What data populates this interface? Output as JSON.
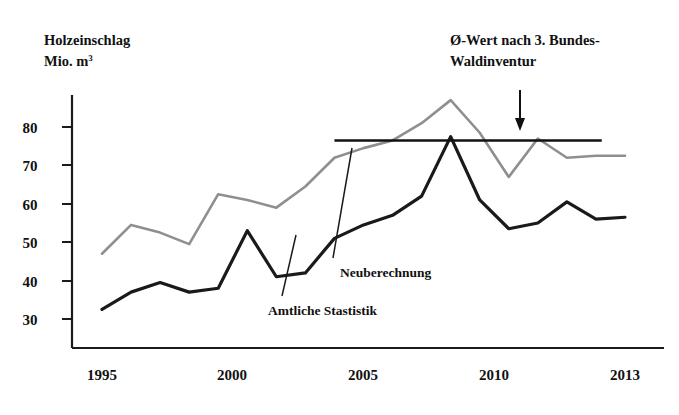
{
  "chart_data": {
    "type": "line",
    "title": "Holzeinschlag",
    "subtitle": "Mio. m³",
    "ylabel": "Holzeinschlag Mio. m3",
    "xlabel": "",
    "xlim": [
      1995,
      2013
    ],
    "ylim": [
      25,
      90
    ],
    "grid": false,
    "legend": "inline-annotations",
    "x": [
      1995,
      1996,
      1997,
      1998,
      1999,
      2000,
      2001,
      2002,
      2003,
      2004,
      2005,
      2006,
      2007,
      2008,
      2009,
      2010,
      2011,
      2012,
      2013
    ],
    "y_ticks": [
      30,
      40,
      50,
      60,
      70,
      80
    ],
    "x_ticks": [
      1995,
      2000,
      2005,
      2010,
      2013
    ],
    "series": [
      {
        "name": "Amtliche Stastistik",
        "color": "#1a1a1a",
        "values": [
          32.5,
          37.0,
          39.5,
          37.0,
          38.0,
          53.0,
          41.0,
          42.0,
          51.0,
          54.5,
          57.0,
          62.0,
          77.5,
          61.0,
          53.5,
          55.0,
          60.5,
          56.0,
          56.5
        ]
      },
      {
        "name": "Neuberechnung",
        "color": "#8f8f8f",
        "values": [
          47.0,
          54.5,
          52.5,
          49.5,
          62.5,
          61.0,
          59.0,
          64.5,
          72.0,
          74.5,
          76.5,
          81.0,
          87.0,
          78.5,
          67.0,
          77.0,
          72.0,
          72.5,
          72.5
        ]
      }
    ],
    "reference_line": {
      "label": "Ø-Wert nach 3. Bundes-Waldinventur",
      "value": 76.5,
      "x_start": 2003,
      "x_end": 2012.2,
      "color": "#111111"
    },
    "annotations": [
      {
        "name": "neuberechnung-label",
        "text": "Neuberechnung"
      },
      {
        "name": "amtliche-statistik-label",
        "text": "Amtliche Stastistik"
      },
      {
        "name": "reference-line-label-line1",
        "text": "Ø-Wert nach 3. Bundes-"
      },
      {
        "name": "reference-line-label-line2",
        "text": "Waldinventur"
      }
    ]
  },
  "labels": {
    "title_line1": "Holzeinschlag",
    "title_line2_main": "Mio. m",
    "title_line2_sup": "3",
    "ref_line1": "Ø-Wert nach 3. Bundes-",
    "ref_line2": "Waldinventur",
    "series_dark": "Amtliche Stastistik",
    "series_gray": "Neuberechnung",
    "y_30": "30",
    "y_40": "40",
    "y_50": "50",
    "y_60": "60",
    "y_70": "70",
    "y_80": "80",
    "x_1995": "1995",
    "x_2000": "2000",
    "x_2005": "2005",
    "x_2010": "2010",
    "x_2013": "2013"
  },
  "colors": {
    "dark_series": "#1a1a1a",
    "gray_series": "#8f8f8f",
    "axis": "#1a1a1a",
    "background": "#ffffff"
  }
}
